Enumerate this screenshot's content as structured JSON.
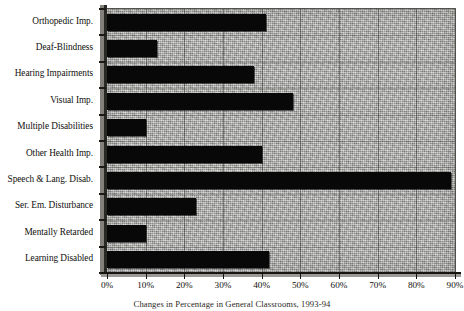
{
  "chart_data": {
    "type": "bar",
    "orientation": "horizontal",
    "title": "",
    "caption": "Changes in Percentage in General Classrooms, 1993-94",
    "xlabel": "",
    "ylabel": "",
    "xlim": [
      0,
      90
    ],
    "grid": true,
    "legend": "none",
    "categories": [
      "Orthopedic Imp.",
      "Deaf-Blindness",
      "Hearing Impairments",
      "Visual Imp.",
      "Multiple Disabilities",
      "Other Health Imp.",
      "Speech & Lang. Disab.",
      "Ser. Em. Disturbance",
      "Mentally Retarded",
      "Learning Disabled"
    ],
    "values": [
      41,
      13,
      38,
      48,
      10,
      40,
      89,
      23,
      10,
      42
    ],
    "value_unit": "%",
    "xticks": [
      0,
      10,
      20,
      30,
      40,
      50,
      60,
      70,
      80,
      90
    ],
    "xtick_labels": [
      "0%",
      "10%",
      "20%",
      "30%",
      "40%",
      "50%",
      "60%",
      "70%",
      "80%",
      "90%"
    ],
    "bar_color": "#080808",
    "plot_background": "#a8a8a6"
  }
}
